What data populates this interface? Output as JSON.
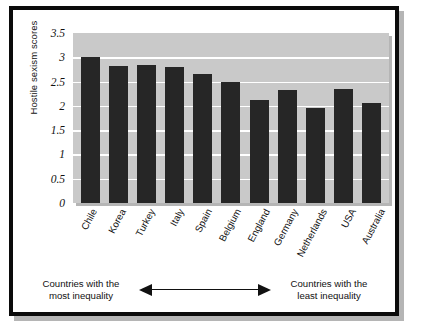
{
  "figure": {
    "frame_color": "#0b0b0b",
    "plot_background": "#c9c9c9",
    "bar_color": "#262626",
    "gridline_color": "#ffffff"
  },
  "chart_data": {
    "type": "bar",
    "title": "",
    "xlabel": "",
    "ylabel": "Hostile sexism scores",
    "ylim": [
      0,
      3.5
    ],
    "yticks": [
      "0",
      "0.5",
      "1",
      "1.5",
      "2",
      "2.5",
      "3",
      "3.5"
    ],
    "ytick_values": [
      0,
      0.5,
      1,
      1.5,
      2,
      2.5,
      3,
      3.5
    ],
    "grid": true,
    "legend": "none",
    "categories": [
      "Chile",
      "Korea",
      "Turkey",
      "Italy",
      "Spain",
      "Belgium",
      "England",
      "Germany",
      "Netherlands",
      "USA",
      "Australia"
    ],
    "values": [
      3.0,
      2.82,
      2.85,
      2.81,
      2.65,
      2.5,
      2.12,
      2.33,
      1.95,
      2.35,
      2.06
    ],
    "annotations": {
      "left_caption": "Countries with the\nmost inequality",
      "right_caption": "Countries with the\nleast inequality",
      "arrow": "double-headed horizontal arrow"
    }
  },
  "caption": {
    "left_line1": "Countries with the",
    "left_line2": "most inequality",
    "right_line1": "Countries with the",
    "right_line2": "least inequality"
  }
}
